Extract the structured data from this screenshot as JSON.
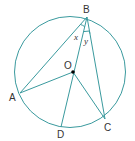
{
  "diagram": {
    "type": "circle-geometry",
    "colors": {
      "stroke": "#3a9a9e",
      "label": "#333333",
      "center_dot": "#000000"
    },
    "circle": {
      "center_label": "O"
    },
    "points": [
      {
        "name": "B",
        "label": "B"
      },
      {
        "name": "A",
        "label": "A"
      },
      {
        "name": "O",
        "label": "O"
      },
      {
        "name": "D",
        "label": "D"
      },
      {
        "name": "C",
        "label": "C"
      }
    ],
    "segments": [
      "BA",
      "BD",
      "BC",
      "OA",
      "OC"
    ],
    "angles": [
      {
        "label": "x",
        "between": [
          "BA",
          "BO"
        ]
      },
      {
        "label": "y",
        "between": [
          "BO",
          "BC"
        ]
      }
    ]
  }
}
